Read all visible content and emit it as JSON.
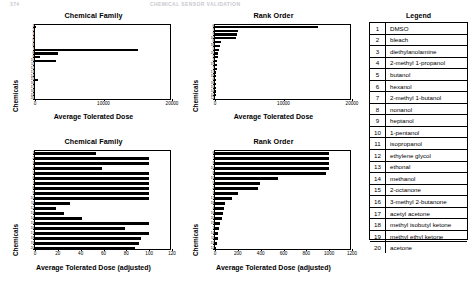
{
  "page_header": {
    "left": "374",
    "right": "CHEMICAL SENSOR VALIDATION"
  },
  "legend": {
    "title": "Legend",
    "items": [
      {
        "num": "1",
        "name": "DMSO"
      },
      {
        "num": "2",
        "name": "bleach"
      },
      {
        "num": "3",
        "name": "diethylanolamine"
      },
      {
        "num": "4",
        "name": "2-methyl 1-propanol"
      },
      {
        "num": "5",
        "name": "butanol"
      },
      {
        "num": "6",
        "name": "hexanol"
      },
      {
        "num": "7",
        "name": "2-methyl 1-butanol"
      },
      {
        "num": "8",
        "name": "nonanol"
      },
      {
        "num": "9",
        "name": "heptanol"
      },
      {
        "num": "10",
        "name": "1-pentanol"
      },
      {
        "num": "11",
        "name": "isopropanol"
      },
      {
        "num": "12",
        "name": "ethylene glycol"
      },
      {
        "num": "13",
        "name": "ethonal"
      },
      {
        "num": "14",
        "name": "methanol"
      },
      {
        "num": "15",
        "name": "2-octanone"
      },
      {
        "num": "16",
        "name": "3-methyl 2-butanone"
      },
      {
        "num": "17",
        "name": "acetyl acetone"
      },
      {
        "num": "18",
        "name": "methyl isobutyl ketone"
      },
      {
        "num": "19",
        "name": "methyl ethyl ketone"
      },
      {
        "num": "20",
        "name": "acetone"
      }
    ]
  },
  "chart_data": [
    {
      "id": "top-left",
      "type": "bar",
      "orientation": "horizontal",
      "title": "Chemical Family",
      "xlabel": "Average Tolerated Dose",
      "ylabel": "Chemicals",
      "xlim": [
        0,
        20000
      ],
      "xticks": [
        0,
        10000,
        20000
      ],
      "xticklabels": [
        "0",
        "10000",
        "20000"
      ],
      "grid": false,
      "categories": [
        "1",
        "2",
        "3",
        "4",
        "5",
        "6",
        "7",
        "8",
        "9",
        "10",
        "11",
        "12",
        "13",
        "14",
        "15",
        "16",
        "17",
        "18",
        "19",
        "20"
      ],
      "values": [
        60,
        0,
        0,
        0,
        0,
        0,
        15000,
        3400,
        800,
        3000,
        0,
        0,
        0,
        0,
        450,
        0,
        0,
        0,
        0,
        0
      ]
    },
    {
      "id": "top-right",
      "type": "bar",
      "orientation": "horizontal",
      "title": "Rank Order",
      "xlabel": "Average Tolerated Dose",
      "ylabel": "Chemicals",
      "xlim": [
        0,
        20000
      ],
      "xticks": [
        0,
        10000,
        20000
      ],
      "xticklabels": [
        "0",
        "10000",
        "20000"
      ],
      "grid": false,
      "categories": [
        "6",
        "7",
        "9",
        "10",
        "8",
        "18",
        "5",
        "20",
        "3",
        "2",
        "19",
        "7",
        "17",
        "19",
        "4",
        "16",
        "15",
        "14",
        "10",
        "12"
      ],
      "values": [
        15000,
        3400,
        3200,
        3000,
        900,
        700,
        600,
        450,
        380,
        330,
        280,
        230,
        190,
        160,
        130,
        110,
        90,
        70,
        50,
        30
      ]
    },
    {
      "id": "bottom-left",
      "type": "bar",
      "orientation": "horizontal",
      "title": "Chemical Family",
      "xlabel": "Average Tolerated Dose (adjusted)",
      "ylabel": "Chemicals",
      "xlim": [
        0,
        120
      ],
      "xticks": [
        0,
        20,
        40,
        60,
        80,
        100,
        120
      ],
      "xticklabels": [
        "0",
        "20",
        "40",
        "60",
        "80",
        "100",
        "120"
      ],
      "grid": false,
      "categories": [
        "1",
        "2",
        "3",
        "4",
        "5",
        "6",
        "7",
        "8",
        "9",
        "10",
        "11",
        "12",
        "13",
        "14",
        "15",
        "16",
        "17",
        "18",
        "19",
        "20"
      ],
      "values": [
        53,
        100,
        100,
        59,
        100,
        100,
        100,
        100,
        100,
        100,
        31,
        18,
        25,
        41,
        100,
        79,
        100,
        93,
        91,
        88
      ]
    },
    {
      "id": "bottom-right",
      "type": "bar",
      "orientation": "horizontal",
      "title": "Rank Order",
      "xlabel": "Average Tolerated Dose (adjusted)",
      "ylabel": "Chemicals",
      "xlim": [
        0,
        1200
      ],
      "xticks": [
        0,
        200,
        400,
        600,
        800,
        1000,
        1200
      ],
      "xticklabels": [
        "0",
        "200",
        "400",
        "600",
        "800",
        "1000",
        "1200"
      ],
      "grid": false,
      "categories": [
        "6",
        "7",
        "9",
        "10",
        "8",
        "15",
        "5",
        "2",
        "3",
        "17",
        "18",
        "4",
        "16",
        "20",
        "19",
        "1",
        "14",
        "11",
        "13",
        "12"
      ],
      "values": [
        1000,
        1000,
        1000,
        1000,
        975,
        550,
        390,
        380,
        205,
        150,
        88,
        80,
        70,
        62,
        45,
        36,
        30,
        24,
        18,
        10
      ]
    }
  ]
}
